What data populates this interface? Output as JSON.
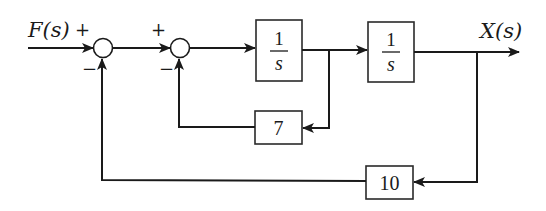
{
  "diagram": {
    "type": "block-diagram",
    "input": {
      "label": "F(s)"
    },
    "output": {
      "label": "X(s)"
    },
    "summing_junctions": [
      {
        "id": "sum1",
        "signs": {
          "input": "+",
          "feedback": "−"
        }
      },
      {
        "id": "sum2",
        "signs": {
          "input": "+",
          "feedback": "−"
        }
      }
    ],
    "forward_blocks": [
      {
        "id": "integrator1",
        "numerator": "1",
        "denominator": "s"
      },
      {
        "id": "integrator2",
        "numerator": "1",
        "denominator": "s"
      }
    ],
    "feedback_blocks": [
      {
        "id": "inner-gain",
        "value": "7"
      },
      {
        "id": "outer-gain",
        "value": "10"
      }
    ],
    "colors": {
      "stroke": "#1a1a1a",
      "background": "#ffffff"
    }
  }
}
